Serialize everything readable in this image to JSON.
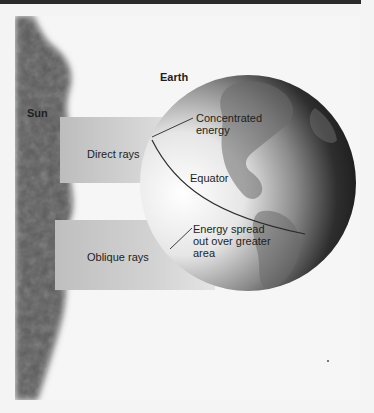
{
  "figure": {
    "labels": {
      "sun": "Sun",
      "earth": "Earth",
      "direct_rays": "Direct rays",
      "oblique_rays": "Oblique rays",
      "concentrated_energy": [
        "Concentrated",
        "energy"
      ],
      "equator": "Equator",
      "energy_spread": [
        "Energy spread",
        "out over greater",
        "area"
      ]
    },
    "icons": {
      "sun": "sun-disc-edge",
      "earth": "globe-western-hemisphere"
    },
    "colors": {
      "top_bar": "#2a2a2a",
      "background": "#f6f6f6",
      "sun": "#555555",
      "ray_band": "#c8c8c8",
      "globe_dark": "#111111",
      "globe_light": "#f2f2f2",
      "text": "#1e1e1e"
    }
  }
}
